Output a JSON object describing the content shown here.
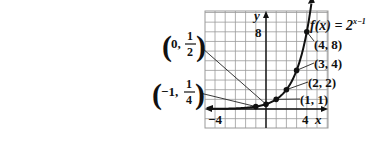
{
  "chart_data": {
    "type": "line",
    "function_label": {
      "prefix": "f(x) = 2",
      "exponent": "x−1"
    },
    "xlabel": "x",
    "ylabel": "y",
    "xlim": [
      -6,
      6
    ],
    "ylim": [
      -2,
      10
    ],
    "grid": true,
    "tick_labels": {
      "x": [
        "−4",
        "4"
      ],
      "y": [
        "8"
      ]
    },
    "series": [
      {
        "name": "f(x) = 2^(x−1)",
        "points": [
          {
            "x": -1,
            "y": 0.25,
            "label_whole": "−1, ",
            "label_num": "1",
            "label_den": "4"
          },
          {
            "x": 0,
            "y": 0.5,
            "label_whole": "0, ",
            "label_num": "1",
            "label_den": "2"
          },
          {
            "x": 1,
            "y": 1,
            "label": "(1, 1)"
          },
          {
            "x": 2,
            "y": 2,
            "label": "(2, 2)"
          },
          {
            "x": 3,
            "y": 4,
            "label": "(3, 4)"
          },
          {
            "x": 4,
            "y": 8,
            "label": "(4, 8)"
          }
        ]
      }
    ]
  },
  "colors": {
    "curve": "#111111",
    "grid": "#9a9a9a",
    "axis": "#111111",
    "background": "#ffffff"
  }
}
